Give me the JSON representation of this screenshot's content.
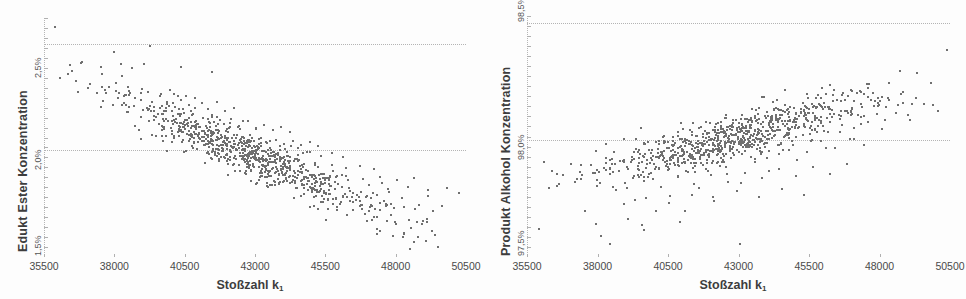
{
  "figure": {
    "background": "#fdfdfd",
    "point_color": "#6f6f6f",
    "gridline_color": "#b4b4b4"
  },
  "chart_data": [
    {
      "id": "edukt-ester",
      "type": "scatter",
      "title": "",
      "xlabel": "Stoßzahl k",
      "xlabel_sub": "1",
      "ylabel": "Edukt Ester Konzentration",
      "xticklabels": [
        "35500",
        "38000",
        "40500",
        "43000",
        "45500",
        "48000",
        "50500"
      ],
      "xticks": [
        35500,
        38000,
        40500,
        43000,
        45500,
        48000,
        50500
      ],
      "yticklabels": [
        "2,5%",
        "2,0%",
        "1,5%"
      ],
      "yticks": [
        2.5,
        2.0,
        1.5
      ],
      "xlim": [
        35500,
        50500
      ],
      "ylim": [
        1.5,
        2.62
      ],
      "grid": true,
      "gridlines_y": [
        2.5,
        2.0,
        1.5
      ],
      "legend": "none",
      "correlation": "negative",
      "n_points": 900,
      "trend": {
        "slope_per_1000": -0.0585,
        "intercept_at_43000": 1.975,
        "scatter_sd": 0.052
      },
      "points": [
        [
          35870,
          2.585
        ],
        [
          36040,
          2.345
        ],
        [
          37520,
          2.3
        ],
        [
          37760,
          2.3
        ],
        [
          37960,
          2.465
        ],
        [
          38190,
          2.41
        ],
        [
          38440,
          2.3
        ],
        [
          38220,
          2.355
        ],
        [
          38600,
          2.39
        ],
        [
          39030,
          2.41
        ],
        [
          39240,
          2.495
        ],
        [
          40320,
          2.395
        ],
        [
          41420,
          2.37
        ],
        [
          37500,
          2.21
        ],
        [
          37900,
          2.215
        ],
        [
          38360,
          2.265
        ],
        [
          38480,
          2.21
        ],
        [
          38700,
          2.25
        ],
        [
          38900,
          2.24
        ],
        [
          39150,
          2.28
        ],
        [
          39380,
          2.21
        ],
        [
          39600,
          2.26
        ],
        [
          39840,
          2.23
        ],
        [
          40100,
          2.27
        ],
        [
          40350,
          2.24
        ],
        [
          40600,
          2.215
        ],
        [
          40830,
          2.25
        ],
        [
          41080,
          2.225
        ],
        [
          41300,
          2.2
        ],
        [
          41600,
          2.23
        ],
        [
          41900,
          2.19
        ],
        [
          42200,
          2.205
        ],
        [
          38700,
          2.12
        ],
        [
          38900,
          2.16
        ],
        [
          39200,
          2.14
        ],
        [
          39500,
          2.175
        ],
        [
          39800,
          2.15
        ],
        [
          40050,
          2.13
        ],
        [
          40300,
          2.165
        ],
        [
          40550,
          2.145
        ],
        [
          40800,
          2.12
        ],
        [
          41100,
          2.155
        ],
        [
          41350,
          2.135
        ],
        [
          41600,
          2.16
        ],
        [
          41850,
          2.13
        ],
        [
          42100,
          2.15
        ],
        [
          42400,
          2.12
        ],
        [
          42700,
          2.14
        ],
        [
          43000,
          2.11
        ],
        [
          43300,
          2.125
        ],
        [
          43600,
          2.1
        ],
        [
          43900,
          2.115
        ],
        [
          44200,
          2.09
        ],
        [
          38900,
          2.06
        ],
        [
          39300,
          2.075
        ],
        [
          39700,
          2.05
        ],
        [
          40100,
          2.07
        ],
        [
          40400,
          2.055
        ],
        [
          40700,
          2.08
        ],
        [
          41000,
          2.06
        ],
        [
          41300,
          2.075
        ],
        [
          41600,
          2.055
        ],
        [
          41900,
          2.07
        ],
        [
          42200,
          2.05
        ],
        [
          42500,
          2.065
        ],
        [
          42800,
          2.045
        ],
        [
          43100,
          2.06
        ],
        [
          43400,
          2.04
        ],
        [
          43700,
          2.055
        ],
        [
          44000,
          2.035
        ],
        [
          44300,
          2.05
        ],
        [
          44600,
          2.03
        ],
        [
          44900,
          2.045
        ],
        [
          45200,
          2.025
        ],
        [
          40500,
          2.0
        ],
        [
          40900,
          2.01
        ],
        [
          41300,
          1.995
        ],
        [
          41700,
          2.005
        ],
        [
          42100,
          1.998
        ],
        [
          42500,
          2.008
        ],
        [
          42900,
          1.992
        ],
        [
          43300,
          2.002
        ],
        [
          43700,
          1.988
        ],
        [
          44100,
          1.998
        ],
        [
          44500,
          1.985
        ],
        [
          44900,
          1.995
        ],
        [
          45300,
          1.98
        ],
        [
          45700,
          1.99
        ],
        [
          46100,
          1.975
        ],
        [
          41200,
          1.945
        ],
        [
          41700,
          1.955
        ],
        [
          42200,
          1.94
        ],
        [
          42700,
          1.95
        ],
        [
          43200,
          1.935
        ],
        [
          43700,
          1.945
        ],
        [
          44200,
          1.93
        ],
        [
          44700,
          1.94
        ],
        [
          45200,
          1.925
        ],
        [
          45700,
          1.935
        ],
        [
          46200,
          1.92
        ],
        [
          46700,
          1.93
        ],
        [
          47200,
          1.915
        ],
        [
          42000,
          1.89
        ],
        [
          42600,
          1.9
        ],
        [
          43200,
          1.885
        ],
        [
          43800,
          1.895
        ],
        [
          44400,
          1.88
        ],
        [
          45000,
          1.89
        ],
        [
          45600,
          1.875
        ],
        [
          46200,
          1.885
        ],
        [
          46800,
          1.87
        ],
        [
          47400,
          1.88
        ],
        [
          48000,
          1.865
        ],
        [
          48600,
          1.875
        ],
        [
          43500,
          1.84
        ],
        [
          44200,
          1.85
        ],
        [
          44900,
          1.835
        ],
        [
          45600,
          1.845
        ],
        [
          46300,
          1.83
        ],
        [
          47000,
          1.84
        ],
        [
          47700,
          1.825
        ],
        [
          48400,
          1.835
        ],
        [
          49100,
          1.82
        ],
        [
          49800,
          1.83
        ],
        [
          50200,
          1.805
        ],
        [
          44600,
          1.79
        ],
        [
          45500,
          1.8
        ],
        [
          46400,
          1.785
        ],
        [
          47300,
          1.795
        ],
        [
          48200,
          1.78
        ],
        [
          49100,
          1.79
        ],
        [
          46000,
          1.755
        ],
        [
          47400,
          1.76
        ],
        [
          48800,
          1.75
        ],
        [
          49600,
          1.745
        ],
        [
          44900,
          1.74
        ],
        [
          47900,
          1.735
        ],
        [
          49300,
          1.72
        ]
      ]
    },
    {
      "id": "produkt-alkohol",
      "type": "scatter",
      "title": "",
      "xlabel": "Stoßzahl k",
      "xlabel_sub": "1",
      "ylabel": "Produkt Alkohol Konzentration",
      "xticklabels": [
        "35500",
        "38000",
        "40500",
        "43000",
        "45500",
        "48000",
        "50500"
      ],
      "xticks": [
        35500,
        38000,
        40500,
        43000,
        45500,
        48000,
        50500
      ],
      "yticklabels": [
        "98,5%",
        "98,0%",
        "97,5%"
      ],
      "yticks": [
        98.5,
        98.0,
        97.5
      ],
      "xlim": [
        35500,
        50500
      ],
      "ylim": [
        97.5,
        98.53
      ],
      "grid": true,
      "gridlines_y": [
        98.5,
        98.0,
        97.5
      ],
      "legend": "none",
      "correlation": "positive",
      "n_points": 900,
      "trend": {
        "slope_per_1000": 0.0305,
        "intercept_at_43000": 98.02,
        "scatter_sd": 0.048
      },
      "points": [
        [
          35880,
          97.625
        ],
        [
          36050,
          97.91
        ],
        [
          37520,
          97.7
        ],
        [
          37950,
          97.835
        ],
        [
          38250,
          97.905
        ],
        [
          38400,
          97.56
        ],
        [
          38620,
          97.79
        ],
        [
          38900,
          98.01
        ],
        [
          39050,
          97.665
        ],
        [
          39300,
          97.75
        ],
        [
          39550,
          97.64
        ],
        [
          39800,
          97.86
        ],
        [
          40050,
          97.7
        ],
        [
          40300,
          97.935
        ],
        [
          40550,
          97.765
        ],
        [
          40800,
          97.85
        ],
        [
          41050,
          97.7
        ],
        [
          41300,
          97.93
        ],
        [
          41550,
          97.8
        ],
        [
          41800,
          97.88
        ],
        [
          42050,
          97.76
        ],
        [
          42300,
          97.99
        ],
        [
          42550,
          97.86
        ],
        [
          42800,
          97.94
        ],
        [
          43050,
          97.82
        ],
        [
          43300,
          98.04
        ],
        [
          43550,
          97.91
        ],
        [
          43800,
          98.0
        ],
        [
          44050,
          97.87
        ],
        [
          44300,
          98.09
        ],
        [
          44550,
          97.96
        ],
        [
          44800,
          98.05
        ],
        [
          45050,
          97.92
        ],
        [
          45300,
          98.13
        ],
        [
          45550,
          98.0
        ],
        [
          45800,
          98.09
        ],
        [
          46050,
          97.97
        ],
        [
          46300,
          98.17
        ],
        [
          46550,
          98.04
        ],
        [
          46800,
          98.13
        ],
        [
          47050,
          98.01
        ],
        [
          47300,
          98.21
        ],
        [
          47550,
          98.08
        ],
        [
          47800,
          98.17
        ],
        [
          48050,
          98.05
        ],
        [
          48300,
          98.25
        ],
        [
          48550,
          98.12
        ],
        [
          48800,
          98.21
        ],
        [
          49050,
          98.09
        ],
        [
          49300,
          98.29
        ],
        [
          49550,
          98.16
        ],
        [
          49800,
          98.25
        ],
        [
          50050,
          98.13
        ],
        [
          50350,
          98.39
        ],
        [
          38400,
          97.88
        ],
        [
          38900,
          97.91
        ],
        [
          39400,
          97.88
        ],
        [
          39900,
          97.92
        ],
        [
          40400,
          97.895
        ],
        [
          40900,
          97.935
        ],
        [
          41400,
          97.905
        ],
        [
          41900,
          97.945
        ],
        [
          42400,
          97.92
        ],
        [
          42900,
          97.96
        ],
        [
          43400,
          97.93
        ],
        [
          43900,
          97.975
        ],
        [
          44400,
          97.945
        ],
        [
          44900,
          97.985
        ],
        [
          45400,
          97.955
        ],
        [
          45900,
          98.0
        ],
        [
          46400,
          97.97
        ],
        [
          46900,
          98.01
        ],
        [
          47400,
          97.985
        ],
        [
          39000,
          97.8
        ],
        [
          39600,
          97.83
        ],
        [
          40200,
          97.805
        ],
        [
          40800,
          97.845
        ],
        [
          41400,
          97.815
        ],
        [
          42000,
          97.855
        ],
        [
          42600,
          97.825
        ],
        [
          43200,
          97.865
        ],
        [
          43800,
          97.84
        ],
        [
          44400,
          97.88
        ],
        [
          45000,
          97.85
        ],
        [
          45600,
          97.89
        ],
        [
          46200,
          97.86
        ],
        [
          46800,
          97.9
        ],
        [
          38900,
          97.73
        ],
        [
          39700,
          97.755
        ],
        [
          40500,
          97.735
        ],
        [
          41300,
          97.77
        ],
        [
          42100,
          97.745
        ],
        [
          42900,
          97.785
        ],
        [
          43700,
          97.76
        ],
        [
          44500,
          97.795
        ],
        [
          45300,
          97.77
        ],
        [
          41000,
          98.05
        ],
        [
          41800,
          98.08
        ],
        [
          42600,
          98.06
        ],
        [
          43400,
          98.1
        ],
        [
          44200,
          98.075
        ],
        [
          45000,
          98.115
        ],
        [
          45800,
          98.09
        ],
        [
          46600,
          98.13
        ],
        [
          47400,
          98.105
        ],
        [
          48200,
          98.145
        ],
        [
          43800,
          98.19
        ],
        [
          44600,
          98.22
        ],
        [
          45400,
          98.2
        ],
        [
          46200,
          98.24
        ],
        [
          47000,
          98.215
        ],
        [
          38100,
          97.595
        ],
        [
          39600,
          97.62
        ],
        [
          40900,
          97.655
        ],
        [
          43000,
          97.56
        ],
        [
          37900,
          97.645
        ]
      ]
    }
  ],
  "charts": [
    {
      "key": "left",
      "ylabel": "Edukt Ester Konzentration",
      "xlabel": "Stoßzahl k",
      "xlabel_sub": "1",
      "yticklabels": [
        "2,5%",
        "2,0%",
        "1,5%"
      ],
      "xticklabels": [
        "35500",
        "38000",
        "40500",
        "43000",
        "45500",
        "48000",
        "50500"
      ]
    },
    {
      "key": "right",
      "ylabel": "Produkt Alkohol Konzentration",
      "xlabel": "Stoßzahl k",
      "xlabel_sub": "1",
      "yticklabels": [
        "98,5%",
        "98,0%",
        "97,5%"
      ],
      "xticklabels": [
        "35500",
        "38000",
        "40500",
        "43000",
        "45500",
        "48000",
        "50500"
      ]
    }
  ]
}
